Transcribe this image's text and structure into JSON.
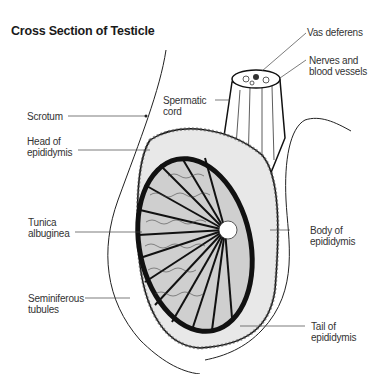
{
  "title": "Cross Section of Testicle",
  "labels": {
    "vas_deferens": "Vas deferens",
    "nerves_line1": "Nerves and",
    "nerves_line2": "blood vessels",
    "spermatic_line1": "Spermatic",
    "spermatic_line2": "cord",
    "scrotum": "Scrotum",
    "head_line1": "Head of",
    "head_line2": "epididymis",
    "tunica_line1": "Tunica",
    "tunica_line2": "albuginea",
    "body_line1": "Body of",
    "body_line2": "epididymis",
    "semi_line1": "Seminiferous",
    "semi_line2": "tubules",
    "tail_line1": "Tail of",
    "tail_line2": "epididymis"
  }
}
